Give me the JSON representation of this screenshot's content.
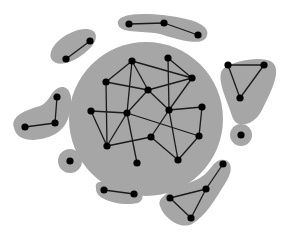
{
  "diagram": {
    "type": "network-clusters",
    "colors": {
      "background": "#ffffff",
      "cluster_fill": "#a6a6a6",
      "node": "#000000",
      "edge": "#1a1a1a"
    },
    "central_cluster": {
      "shape": "circle",
      "cx": 146,
      "cy": 119,
      "r": 77,
      "nodes": [
        {
          "id": "A",
          "x": 132,
          "y": 61
        },
        {
          "id": "B",
          "x": 106,
          "y": 82
        },
        {
          "id": "C",
          "x": 168,
          "y": 58
        },
        {
          "id": "D",
          "x": 192,
          "y": 78
        },
        {
          "id": "E",
          "x": 148,
          "y": 90
        },
        {
          "id": "F",
          "x": 91,
          "y": 111
        },
        {
          "id": "G",
          "x": 127,
          "y": 113
        },
        {
          "id": "H",
          "x": 169,
          "y": 110
        },
        {
          "id": "I",
          "x": 202,
          "y": 107
        },
        {
          "id": "J",
          "x": 151,
          "y": 137
        },
        {
          "id": "K",
          "x": 199,
          "y": 136
        },
        {
          "id": "L",
          "x": 107,
          "y": 146
        },
        {
          "id": "M",
          "x": 137,
          "y": 163
        },
        {
          "id": "N",
          "x": 178,
          "y": 160
        }
      ],
      "edges": [
        [
          "A",
          "B"
        ],
        [
          "A",
          "E"
        ],
        [
          "A",
          "D"
        ],
        [
          "A",
          "G"
        ],
        [
          "B",
          "E"
        ],
        [
          "B",
          "L"
        ],
        [
          "C",
          "D"
        ],
        [
          "C",
          "H"
        ],
        [
          "D",
          "E"
        ],
        [
          "D",
          "H"
        ],
        [
          "E",
          "G"
        ],
        [
          "E",
          "H"
        ],
        [
          "F",
          "G"
        ],
        [
          "F",
          "L"
        ],
        [
          "G",
          "L"
        ],
        [
          "G",
          "M"
        ],
        [
          "G",
          "K"
        ],
        [
          "H",
          "I"
        ],
        [
          "H",
          "J"
        ],
        [
          "H",
          "N"
        ],
        [
          "I",
          "K"
        ],
        [
          "J",
          "L"
        ],
        [
          "J",
          "N"
        ],
        [
          "K",
          "N"
        ]
      ]
    },
    "outer_clusters": [
      {
        "name": "top-chain",
        "hull": "M 118 24 C 116 14, 140 12, 170 16 C 200 20, 212 28, 206 38 C 200 46, 180 40, 160 34 C 140 30, 120 34, 118 24 Z",
        "nodes": [
          {
            "x": 129,
            "y": 24
          },
          {
            "x": 164,
            "y": 23
          },
          {
            "x": 198,
            "y": 35
          }
        ],
        "edges": [
          [
            0,
            1
          ],
          [
            1,
            2
          ]
        ]
      },
      {
        "name": "upper-left-pair",
        "hull": "M 52 60 C 46 52, 58 36, 78 30 C 96 26, 100 36, 92 46 C 82 58, 60 70, 52 60 Z",
        "nodes": [
          {
            "x": 66,
            "y": 59
          },
          {
            "x": 90,
            "y": 41
          }
        ],
        "edges": [
          [
            0,
            1
          ]
        ]
      },
      {
        "name": "left-chain",
        "hull": "M 14 128 C 10 116, 26 110, 40 106 C 50 102, 50 92, 58 88 C 68 84, 74 94, 70 112 C 66 132, 52 138, 34 140 C 22 140, 16 136, 14 128 Z",
        "nodes": [
          {
            "x": 25,
            "y": 127
          },
          {
            "x": 55,
            "y": 123
          },
          {
            "x": 57,
            "y": 97
          }
        ],
        "edges": [
          [
            0,
            1
          ],
          [
            1,
            2
          ]
        ]
      },
      {
        "name": "right-triangle",
        "hull": "M 224 68 C 236 60, 262 56, 272 62 C 282 70, 272 90, 262 110 C 254 126, 236 130, 232 116 C 228 102, 214 76, 224 68 Z",
        "nodes": [
          {
            "x": 228,
            "y": 65
          },
          {
            "x": 264,
            "y": 65
          },
          {
            "x": 240,
            "y": 98
          }
        ],
        "edges": [
          [
            0,
            1
          ],
          [
            1,
            2
          ],
          [
            2,
            0
          ]
        ]
      },
      {
        "name": "right-singleton",
        "shape": "circle",
        "cx": 241,
        "cy": 135,
        "r": 11,
        "nodes": [
          {
            "x": 241,
            "y": 135
          }
        ],
        "edges": []
      },
      {
        "name": "left-singleton",
        "shape": "circle",
        "cx": 70,
        "cy": 161,
        "r": 12,
        "nodes": [
          {
            "x": 70,
            "y": 161
          }
        ],
        "edges": []
      },
      {
        "name": "bottom-pair",
        "hull": "M 96 188 C 94 180, 106 180, 124 184 C 142 188, 146 196, 140 202 C 132 206, 112 204, 102 198 C 96 194, 96 190, 96 188 Z",
        "nodes": [
          {
            "x": 104,
            "y": 190
          },
          {
            "x": 134,
            "y": 194
          }
        ],
        "edges": [
          [
            0,
            1
          ]
        ]
      },
      {
        "name": "bottom-right-triangle",
        "hull": "M 160 206 C 156 196, 176 188, 196 180 C 210 174, 212 162, 220 160 C 232 158, 234 170, 226 182 C 216 198, 206 216, 192 224 C 180 230, 164 218, 160 206 Z",
        "nodes": [
          {
            "x": 170,
            "y": 198
          },
          {
            "x": 206,
            "y": 189
          },
          {
            "x": 223,
            "y": 164
          },
          {
            "x": 191,
            "y": 218
          }
        ],
        "edges": [
          [
            0,
            1
          ],
          [
            1,
            2
          ],
          [
            1,
            3
          ],
          [
            3,
            0
          ]
        ]
      }
    ]
  }
}
